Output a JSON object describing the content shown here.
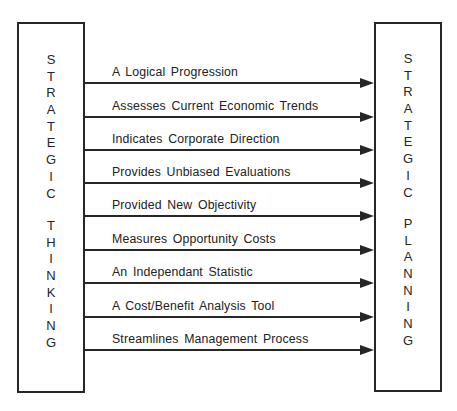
{
  "diagram": {
    "left_box": {
      "words": [
        "STRATEGIC",
        "THINKING"
      ],
      "letters_word1": [
        "S",
        "T",
        "R",
        "A",
        "T",
        "E",
        "G",
        "I",
        "C"
      ],
      "letters_word2": [
        "T",
        "H",
        "I",
        "N",
        "K",
        "I",
        "N",
        "G"
      ]
    },
    "right_box": {
      "words": [
        "STRATEGIC",
        "PLANNING"
      ],
      "letters_word1": [
        "S",
        "T",
        "R",
        "A",
        "T",
        "E",
        "G",
        "I",
        "C"
      ],
      "letters_word2": [
        "P",
        "L",
        "A",
        "N",
        "N",
        "I",
        "N",
        "G"
      ]
    },
    "arrows": [
      {
        "label": "A Logical Progression"
      },
      {
        "label": "Assesses Current Economic Trends"
      },
      {
        "label": "Indicates Corporate Direction"
      },
      {
        "label": "Provides Unbiased Evaluations"
      },
      {
        "label": "Provided New Objectivity"
      },
      {
        "label": "Measures Opportunity Costs"
      },
      {
        "label": "An Independant Statistic"
      },
      {
        "label": "A Cost/Benefit Analysis Tool"
      },
      {
        "label": "Streamlines Management Process"
      }
    ],
    "arrow_direction": "left-to-right",
    "colors": {
      "line": "#262626",
      "background": "#ffffff"
    }
  }
}
